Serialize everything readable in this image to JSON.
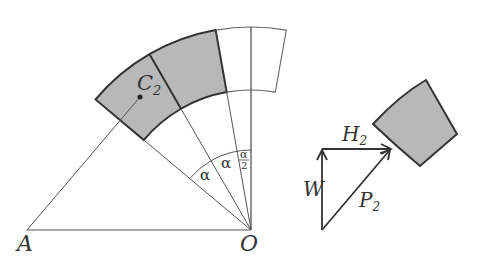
{
  "diagram": {
    "type": "geometry-statics",
    "labels": {
      "A": "A",
      "O": "O",
      "C2": "C",
      "C2_sub": "2",
      "alpha1": "α",
      "alpha2": "α",
      "half_alpha_num": "α",
      "half_alpha_den": "2",
      "W": "W",
      "H2": "H",
      "H2_sub": "2",
      "P2": "P",
      "P2_sub": "2"
    },
    "colors": {
      "line": "#555555",
      "bold_line": "#333333",
      "shade": "#b8b8b8",
      "background": "#ffffff"
    }
  }
}
